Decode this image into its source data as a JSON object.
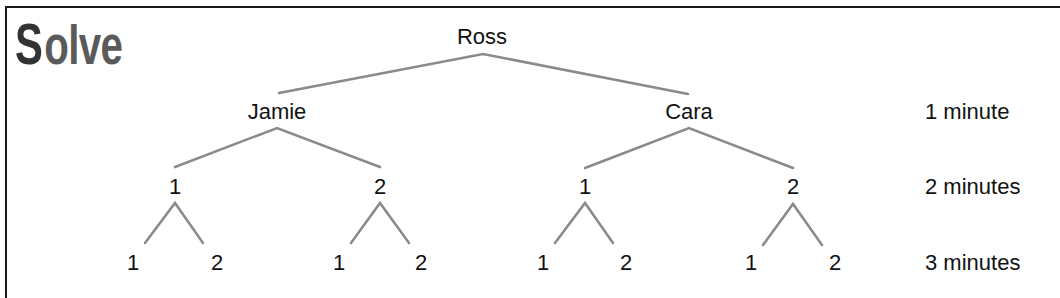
{
  "title": {
    "first_letter": "S",
    "rest": "olve"
  },
  "tree": {
    "root": "Ross",
    "level1": [
      "Jamie",
      "Cara"
    ],
    "level2": [
      "1",
      "2",
      "1",
      "2"
    ],
    "level3": [
      "1",
      "2",
      "1",
      "2",
      "1",
      "2",
      "1",
      "2"
    ]
  },
  "time_labels": [
    "1 minute",
    "2 minutes",
    "3 minutes"
  ],
  "colors": {
    "line": "#8a8a8a",
    "text": "#111111",
    "frame": "#1a1a1a"
  }
}
